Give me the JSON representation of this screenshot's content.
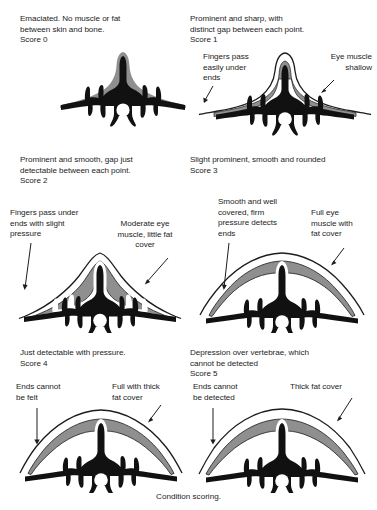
{
  "figure": {
    "footer_label": "Condition scoring.",
    "colors": {
      "bone": "#111111",
      "muscle": "#8f8f8f",
      "fat_outline": "#1c1c1c",
      "background": "#ffffff",
      "text": "#1c1c1c"
    }
  },
  "panels": [
    {
      "id": "score-0",
      "caption": "Emaciated. No muscle or fat\nbetween skin and bone.\nScore 0",
      "score_label": "Score 0",
      "callouts": []
    },
    {
      "id": "score-1",
      "caption": "Prominent and sharp, with\ndistinct gap between each point.\nScore 1",
      "score_label": "Score 1",
      "callouts": [
        {
          "id": "score-1-left",
          "text": "Fingers pass\neasily under\nends"
        },
        {
          "id": "score-1-right",
          "text": "Eye muscle\nshallow"
        }
      ]
    },
    {
      "id": "score-2",
      "caption": "Prominent and smooth, gap just\ndetectable between each point.\nScore 2",
      "score_label": "Score 2",
      "callouts": [
        {
          "id": "score-2-left",
          "text": "Fingers pass under\nends with slight\npressure"
        },
        {
          "id": "score-2-right",
          "text": "Moderate eye\nmuscle, little fat\ncover"
        }
      ]
    },
    {
      "id": "score-3",
      "caption": "Slight prominent, smooth and rounded\nScore 3",
      "score_label": "Score 3",
      "callouts": [
        {
          "id": "score-3-left",
          "text": "Smooth and well\ncovered, firm\npressure detects\nends"
        },
        {
          "id": "score-3-right",
          "text": "Full eye\nmuscle with\nfat cover"
        }
      ]
    },
    {
      "id": "score-4",
      "caption": "Just detectable with pressure.\nScore 4",
      "score_label": "Score 4",
      "callouts": [
        {
          "id": "score-4-left",
          "text": "Ends cannot\nbe felt"
        },
        {
          "id": "score-4-right",
          "text": "Full with thick\nfat cover"
        }
      ]
    },
    {
      "id": "score-5",
      "caption": "Depression over vertebrae, which\ncannot be detected\nScore 5",
      "score_label": "Score 5",
      "callouts": [
        {
          "id": "score-5-left",
          "text": "Ends cannot\nbe detected"
        },
        {
          "id": "score-5-right",
          "text": "Thick fat cover"
        }
      ]
    }
  ]
}
